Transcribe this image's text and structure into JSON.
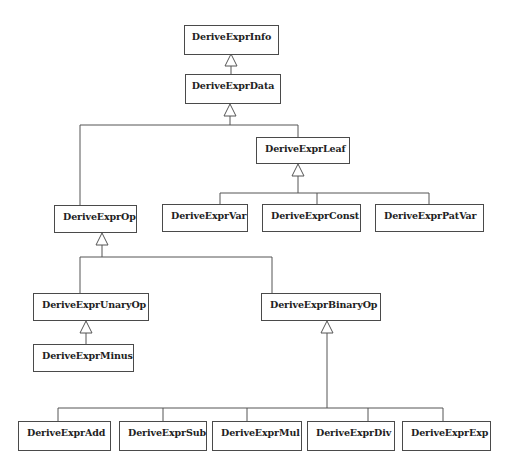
{
  "diagram": {
    "type": "uml-class-inheritance",
    "classes": [
      {
        "id": "info",
        "label": "DeriveExprInfo"
      },
      {
        "id": "data",
        "label": "DeriveExprData"
      },
      {
        "id": "leaf",
        "label": "DeriveExprLeaf"
      },
      {
        "id": "op",
        "label": "DeriveExprOp"
      },
      {
        "id": "var",
        "label": "DeriveExprVar"
      },
      {
        "id": "const",
        "label": "DeriveExprConst"
      },
      {
        "id": "patvar",
        "label": "DeriveExprPatVar"
      },
      {
        "id": "unary",
        "label": "DeriveExprUnaryOp"
      },
      {
        "id": "minus",
        "label": "DeriveExprMinus"
      },
      {
        "id": "binary",
        "label": "DeriveExprBinaryOp"
      },
      {
        "id": "add",
        "label": "DeriveExprAdd"
      },
      {
        "id": "sub",
        "label": "DeriveExprSub"
      },
      {
        "id": "mul",
        "label": "DeriveExprMul"
      },
      {
        "id": "div",
        "label": "DeriveExprDiv"
      },
      {
        "id": "exp",
        "label": "DeriveExprExp"
      }
    ],
    "inheritance": [
      {
        "child": "DeriveExprData",
        "parent": "DeriveExprInfo"
      },
      {
        "child": "DeriveExprOp",
        "parent": "DeriveExprData"
      },
      {
        "child": "DeriveExprLeaf",
        "parent": "DeriveExprData"
      },
      {
        "child": "DeriveExprVar",
        "parent": "DeriveExprLeaf"
      },
      {
        "child": "DeriveExprConst",
        "parent": "DeriveExprLeaf"
      },
      {
        "child": "DeriveExprPatVar",
        "parent": "DeriveExprLeaf"
      },
      {
        "child": "DeriveExprUnaryOp",
        "parent": "DeriveExprOp"
      },
      {
        "child": "DeriveExprBinaryOp",
        "parent": "DeriveExprOp"
      },
      {
        "child": "DeriveExprMinus",
        "parent": "DeriveExprUnaryOp"
      },
      {
        "child": "DeriveExprAdd",
        "parent": "DeriveExprBinaryOp"
      },
      {
        "child": "DeriveExprSub",
        "parent": "DeriveExprBinaryOp"
      },
      {
        "child": "DeriveExprMul",
        "parent": "DeriveExprBinaryOp"
      },
      {
        "child": "DeriveExprDiv",
        "parent": "DeriveExprBinaryOp"
      },
      {
        "child": "DeriveExprExp",
        "parent": "DeriveExprBinaryOp"
      }
    ],
    "colors": {
      "line": "#4a4a4a",
      "text": "#222222",
      "background": "#ffffff"
    }
  }
}
